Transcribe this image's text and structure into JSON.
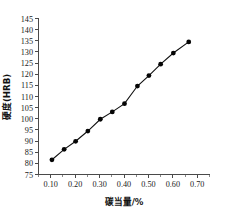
{
  "chart_data": {
    "type": "line",
    "title": "",
    "xlabel": "碳当量/%",
    "ylabel": "硬度(HRB)",
    "xlim": [
      0.05,
      0.75
    ],
    "ylim": [
      75,
      145
    ],
    "xticks": [
      "0.10",
      "0.20",
      "0.30",
      "0.40",
      "0.50",
      "0.60",
      "0.70"
    ],
    "xtick_values": [
      0.1,
      0.2,
      0.3,
      0.4,
      0.5,
      0.6,
      0.7
    ],
    "yticks": [
      "145",
      "140",
      "135",
      "130",
      "125",
      "120",
      "115",
      "110",
      "105",
      "100",
      "95",
      "90",
      "85",
      "80",
      "75"
    ],
    "ytick_values": [
      145,
      140,
      135,
      130,
      125,
      120,
      115,
      110,
      105,
      100,
      95,
      90,
      85,
      80,
      75
    ],
    "grid": false,
    "legend": false,
    "marker": "filled-circle",
    "line_color": "#111111",
    "marker_color": "#050505",
    "axis_color": "#4a4a4a",
    "x": [
      0.105,
      0.155,
      0.202,
      0.252,
      0.303,
      0.352,
      0.402,
      0.455,
      0.502,
      0.55,
      0.602,
      0.665
    ],
    "values": [
      81.6,
      86.3,
      89.9,
      94.5,
      99.8,
      103.1,
      106.8,
      114.7,
      119.4,
      124.5,
      129.5,
      134.5
    ],
    "series": [
      {
        "name": "硬度(HRB)",
        "points": [
          {
            "x": 0.105,
            "y": 81.6
          },
          {
            "x": 0.155,
            "y": 86.3
          },
          {
            "x": 0.202,
            "y": 89.9
          },
          {
            "x": 0.252,
            "y": 94.5
          },
          {
            "x": 0.303,
            "y": 99.8
          },
          {
            "x": 0.352,
            "y": 103.1
          },
          {
            "x": 0.402,
            "y": 106.8
          },
          {
            "x": 0.455,
            "y": 114.7
          },
          {
            "x": 0.502,
            "y": 119.4
          },
          {
            "x": 0.55,
            "y": 124.5
          },
          {
            "x": 0.602,
            "y": 129.5
          },
          {
            "x": 0.665,
            "y": 134.5
          }
        ]
      }
    ]
  }
}
